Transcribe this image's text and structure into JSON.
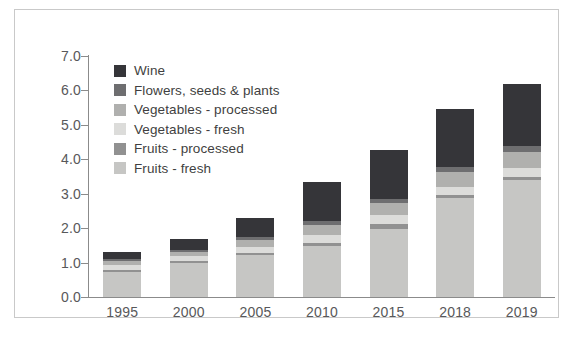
{
  "chart_data": {
    "type": "bar",
    "subtype": "stacked-bar",
    "title": "",
    "xlabel": "",
    "ylabel": "",
    "ylim": [
      0.0,
      7.0
    ],
    "ytick_step": 1.0,
    "ytick_labels": [
      "7.0",
      "6.0",
      "5.0",
      "4.0",
      "3.0",
      "2.0",
      "1.0",
      "0.0"
    ],
    "ytick_values": [
      7.0,
      6.0,
      5.0,
      4.0,
      3.0,
      2.0,
      1.0,
      0.0
    ],
    "grid": false,
    "legend_position": "inside-top-left",
    "categories": [
      "1995",
      "2000",
      "2005",
      "2010",
      "2015",
      "2018",
      "2019"
    ],
    "series": [
      {
        "name": "Fruits - fresh",
        "color": "#c6c6c4",
        "values": [
          0.73,
          1.0,
          1.22,
          1.47,
          1.97,
          2.88,
          3.4
        ]
      },
      {
        "name": "Fruits - processed",
        "color": "#919191",
        "values": [
          0.05,
          0.05,
          0.07,
          0.09,
          0.14,
          0.08,
          0.09
        ]
      },
      {
        "name": "Vegetables - fresh",
        "color": "#dcdcda",
        "values": [
          0.14,
          0.14,
          0.17,
          0.24,
          0.28,
          0.25,
          0.25
        ]
      },
      {
        "name": "Vegetables - processed",
        "color": "#b0b0ae",
        "values": [
          0.13,
          0.13,
          0.21,
          0.28,
          0.33,
          0.42,
          0.48
        ]
      },
      {
        "name": "Flowers, seeds & plants",
        "color": "#6e6e70",
        "values": [
          0.06,
          0.06,
          0.08,
          0.12,
          0.14,
          0.15,
          0.16
        ]
      },
      {
        "name": "Wine",
        "color": "#353539",
        "values": [
          0.19,
          0.32,
          0.55,
          1.15,
          1.41,
          1.67,
          1.82
        ]
      }
    ],
    "totals": [
      1.3,
      1.7,
      2.3,
      3.35,
      4.27,
      5.45,
      6.2
    ]
  },
  "legend": {
    "items": [
      {
        "label": "Wine",
        "color": "#353539"
      },
      {
        "label": "Flowers, seeds & plants",
        "color": "#6e6e70"
      },
      {
        "label": "Vegetables - processed",
        "color": "#b0b0ae"
      },
      {
        "label": "Vegetables - fresh",
        "color": "#dcdcda"
      },
      {
        "label": "Fruits - processed",
        "color": "#919191"
      },
      {
        "label": "Fruits - fresh",
        "color": "#c6c6c4"
      }
    ]
  },
  "colors": {
    "frame_border": "#c9c9c9",
    "axis": "#8b8b8b",
    "tick_text": "#58585a",
    "legend_text": "#3f3f41",
    "background": "#ffffff"
  }
}
